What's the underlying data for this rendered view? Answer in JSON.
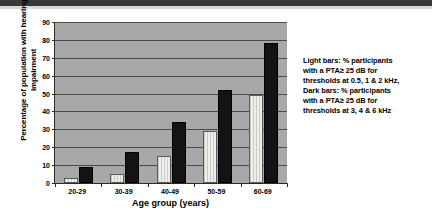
{
  "chart_data": {
    "type": "bar",
    "title": "",
    "xlabel": "Age group (years)",
    "ylabel": "Percentage of population with hearing impairment",
    "categories": [
      "20-29",
      "30-39",
      "40-49",
      "50-59",
      "60-69"
    ],
    "ylim": [
      0,
      90
    ],
    "ytick_step": 10,
    "yticks": [
      "90",
      "80",
      "70",
      "60",
      "50",
      "40",
      "30",
      "20",
      "10",
      "0"
    ],
    "grid": true,
    "legend_position": "right-outside",
    "series": [
      {
        "name": "Light bars",
        "color": "#eeeeea",
        "values": [
          3,
          5,
          15,
          29,
          49
        ]
      },
      {
        "name": "Dark bars",
        "color": "#131313",
        "values": [
          9,
          17.5,
          34,
          52,
          78
        ]
      }
    ],
    "legend_lines": [
      "Light bars: % participants",
      "with a PTA≥ 25 dB for",
      "thresholds at 0.5, 1 & 2 kHz,",
      "Dark bars: % participants",
      "with a PTA≥ 25 dB for",
      "thresholds at 3, 4 & 6 kHz"
    ]
  }
}
